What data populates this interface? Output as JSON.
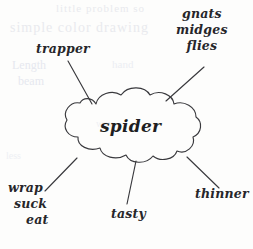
{
  "diagram": {
    "type": "mind-map",
    "medium": "hand-drawn ink on paper",
    "center": {
      "shape": "cloud-bubble",
      "text": "spider"
    },
    "ink_color": "#26262a",
    "paper_color": "#fdfdfc",
    "branches": [
      {
        "id": "trapper",
        "position": "top-left",
        "lines": [
          "trapper"
        ],
        "text": "trapper"
      },
      {
        "id": "gnats-midges-flies",
        "position": "top-right",
        "lines": [
          "gnats",
          "midges",
          "flies"
        ],
        "text": "gnats midges flies"
      },
      {
        "id": "wrap-suck-eat",
        "position": "bottom-left",
        "lines": [
          "wrap",
          "suck",
          "eat"
        ],
        "text": "wrap suck eat"
      },
      {
        "id": "tasty",
        "position": "bottom-center",
        "lines": [
          "tasty"
        ],
        "text": "tasty"
      },
      {
        "id": "thinner",
        "position": "bottom-right",
        "lines": [
          "thinner"
        ],
        "text": "thinner"
      }
    ]
  },
  "background_showthrough": {
    "note": "faint illegible ghost text bleeding through the page",
    "fragments": [
      "little problem so",
      "simple color drawing",
      "Length",
      "beam",
      "hand",
      "less",
      "way"
    ]
  }
}
